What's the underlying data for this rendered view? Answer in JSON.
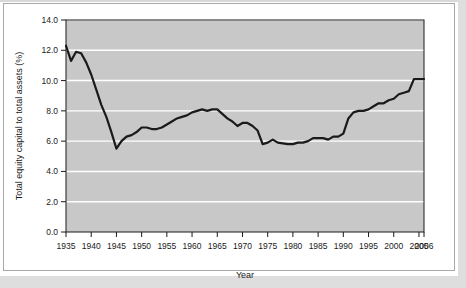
{
  "chart_data": {
    "type": "line",
    "title": "",
    "xlabel": "Year",
    "ylabel": "Total equity capital to total assets (%)",
    "xlim": [
      1935,
      2006
    ],
    "ylim": [
      0.0,
      14.0
    ],
    "grid": true,
    "legend": "none",
    "x_ticks": [
      1935,
      1940,
      1945,
      1950,
      1955,
      1960,
      1965,
      1970,
      1975,
      1980,
      1985,
      1990,
      1995,
      2000,
      2005,
      2006
    ],
    "x_tick_labels": [
      "1935",
      "1940",
      "1945",
      "1950",
      "1955",
      "1960",
      "1965",
      "1970",
      "1975",
      "1980",
      "1985",
      "1990",
      "1995",
      "2000",
      "2005",
      "2006"
    ],
    "y_ticks": [
      0.0,
      2.0,
      4.0,
      6.0,
      8.0,
      10.0,
      12.0,
      14.0
    ],
    "y_tick_labels": [
      "0.0",
      "2.0",
      "4.0",
      "6.0",
      "8.0",
      "10.0",
      "12.0",
      "14.0"
    ],
    "series": [
      {
        "name": "Total equity capital to total assets",
        "color": "#1a1a1a",
        "x": [
          1935,
          1936,
          1937,
          1938,
          1939,
          1940,
          1941,
          1942,
          1943,
          1944,
          1945,
          1946,
          1947,
          1948,
          1949,
          1950,
          1951,
          1952,
          1953,
          1954,
          1955,
          1956,
          1957,
          1958,
          1959,
          1960,
          1961,
          1962,
          1963,
          1964,
          1965,
          1966,
          1967,
          1968,
          1969,
          1970,
          1971,
          1972,
          1973,
          1974,
          1975,
          1976,
          1977,
          1978,
          1979,
          1980,
          1981,
          1982,
          1983,
          1984,
          1985,
          1986,
          1987,
          1988,
          1989,
          1990,
          1991,
          1992,
          1993,
          1994,
          1995,
          1996,
          1997,
          1998,
          1999,
          2000,
          2001,
          2002,
          2003,
          2004,
          2005,
          2006
        ],
        "y": [
          12.3,
          11.3,
          11.9,
          11.8,
          11.2,
          10.4,
          9.4,
          8.4,
          7.6,
          6.6,
          5.5,
          6.0,
          6.3,
          6.4,
          6.6,
          6.9,
          6.9,
          6.8,
          6.8,
          6.9,
          7.1,
          7.3,
          7.5,
          7.6,
          7.7,
          7.9,
          8.0,
          8.1,
          8.0,
          8.1,
          8.1,
          7.8,
          7.5,
          7.3,
          7.0,
          7.2,
          7.2,
          7.0,
          6.7,
          5.8,
          5.9,
          6.1,
          5.9,
          5.85,
          5.8,
          5.8,
          5.9,
          5.9,
          6.0,
          6.2,
          6.2,
          6.2,
          6.1,
          6.3,
          6.3,
          6.5,
          7.5,
          7.9,
          8.0,
          8.0,
          8.1,
          8.3,
          8.5,
          8.5,
          8.7,
          8.8,
          9.1,
          9.2,
          9.3,
          10.1,
          10.1,
          10.1
        ]
      }
    ],
    "annotations": []
  },
  "style": {
    "plot_background": "#c8c8c8",
    "gridline_color": "#ffffff",
    "axis_color": "#1a1a1a",
    "figure_background": "#ffffff",
    "page_background": "#e0e0e0"
  }
}
